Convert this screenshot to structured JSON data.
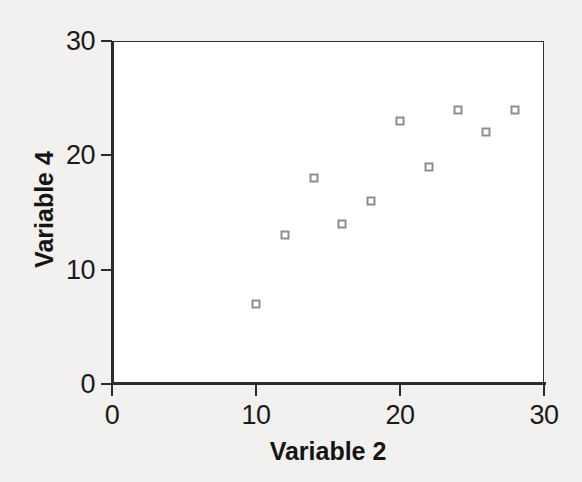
{
  "chart_data": {
    "type": "scatter",
    "title": "",
    "xlabel": "Variable 2",
    "ylabel": "Variable 4",
    "xlim": [
      0,
      30
    ],
    "ylim": [
      0,
      30
    ],
    "xticks": [
      0,
      10,
      20,
      30
    ],
    "yticks": [
      0,
      10,
      20,
      30
    ],
    "xtick_labels": [
      "0",
      "10",
      "20",
      "30"
    ],
    "ytick_labels": [
      "0",
      "10",
      "20",
      "30"
    ],
    "grid": false,
    "legend": null,
    "series": [
      {
        "name": "Variable 4 vs Variable 2",
        "marker": "open-square",
        "marker_color": "#8d8d96",
        "points": [
          {
            "x": 10,
            "y": 7
          },
          {
            "x": 12,
            "y": 13
          },
          {
            "x": 14,
            "y": 18
          },
          {
            "x": 16,
            "y": 14
          },
          {
            "x": 18,
            "y": 16
          },
          {
            "x": 20,
            "y": 23
          },
          {
            "x": 22,
            "y": 19
          },
          {
            "x": 24,
            "y": 24
          },
          {
            "x": 26,
            "y": 22
          },
          {
            "x": 28,
            "y": 24
          }
        ]
      }
    ],
    "x": [
      10,
      12,
      14,
      16,
      18,
      20,
      22,
      24,
      26,
      28
    ],
    "values": [
      7,
      13,
      18,
      14,
      16,
      23,
      19,
      24,
      22,
      24
    ],
    "colors": {
      "background": "#f2f1ef",
      "plot_background": "#ffffff",
      "axis": "#2b2b2b",
      "marker": "#8d8d96",
      "text": "#141414"
    }
  }
}
